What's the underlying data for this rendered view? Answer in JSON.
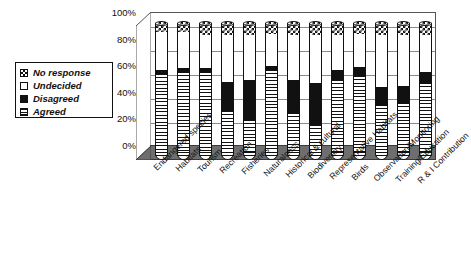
{
  "chart_data": {
    "type": "bar",
    "subtype": "100% stacked cylinder (3-D)",
    "title": "",
    "xlabel": "",
    "ylabel": "",
    "ylim": [
      0,
      100
    ],
    "yticks": [
      "0%",
      "20%",
      "40%",
      "60%",
      "80%",
      "100%"
    ],
    "grid": true,
    "legend_position": "left",
    "categories": [
      "Endangered species",
      "Habitats",
      "Tourism",
      "Recreation",
      "Fisheries",
      "Naturalness",
      "Historical & cultural",
      "Biodiversity",
      "Representative Habitats",
      "Birds",
      "Observation/Monitoring",
      "Training/Education",
      "R & I Contribution"
    ],
    "series": [
      {
        "name": "Agreed",
        "values": [
          62,
          63,
          63,
          34,
          27,
          65,
          32,
          23,
          57,
          60,
          38,
          40,
          55
        ]
      },
      {
        "name": "Disagreed",
        "values": [
          3,
          3,
          3,
          22,
          30,
          3,
          25,
          32,
          8,
          7,
          14,
          13,
          8
        ]
      },
      {
        "name": "Undecided",
        "values": [
          28,
          27,
          25,
          35,
          34,
          24,
          34,
          36,
          26,
          25,
          39,
          38,
          28
        ]
      },
      {
        "name": "No response",
        "values": [
          7,
          7,
          9,
          9,
          9,
          8,
          9,
          9,
          9,
          8,
          9,
          9,
          9
        ]
      }
    ]
  },
  "legend": {
    "items": [
      {
        "label": "No response",
        "pattern": "checkered"
      },
      {
        "label": "Undecided",
        "pattern": "white"
      },
      {
        "label": "Disagreed",
        "pattern": "black"
      },
      {
        "label": "Agreed",
        "pattern": "horizontal-lines"
      }
    ]
  },
  "colors": {
    "ink": "#111111",
    "grid": "#8a8a8a",
    "floor": "#6e6e6e",
    "background": "#ffffff"
  }
}
